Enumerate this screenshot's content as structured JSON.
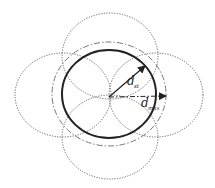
{
  "diagram": {
    "colors": {
      "solid_circle": "#222222",
      "dashdot_circle": "#777777",
      "dotted_circles": "#666666",
      "arrows": "#222222"
    },
    "labels": {
      "inner_radius": {
        "main": "d",
        "sub": "st"
      },
      "outer_radius": {
        "main": "d",
        "sub": "max"
      }
    }
  }
}
